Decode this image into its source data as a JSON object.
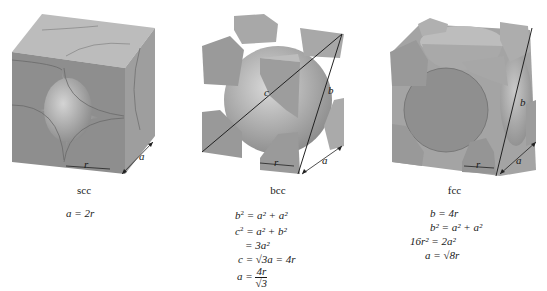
{
  "panels": [
    {
      "id": "scc",
      "caption": "scc",
      "labels": {
        "r": "r",
        "a": "a"
      },
      "equations": [
        "a = 2r"
      ]
    },
    {
      "id": "bcc",
      "caption": "bcc",
      "labels": {
        "r": "r",
        "a": "a",
        "b": "b",
        "c": "c"
      },
      "equations": [
        {
          "lhs": "b",
          "lhs_sup": "2",
          "rhs": "= a² + a²"
        },
        {
          "lhs": "c",
          "lhs_sup": "2",
          "rhs": "= a² + b²"
        },
        {
          "lhs": "",
          "lhs_sup": "",
          "rhs": "= 3a²"
        },
        {
          "lhs": "c",
          "lhs_sup": "",
          "rhs": "= √3a = 4r"
        },
        {
          "lhs": "a",
          "lhs_sup": "",
          "rhs": "=",
          "frac_num": "4r",
          "frac_den": "√3"
        }
      ]
    },
    {
      "id": "fcc",
      "caption": "fcc",
      "labels": {
        "r": "r",
        "a": "a",
        "b": "b"
      },
      "equations": [
        {
          "lhs": "b",
          "rhs": "= 4r"
        },
        {
          "lhs": "b²",
          "rhs": "= a² + a²"
        },
        {
          "lhs": "16r²",
          "rhs": "= 2a²"
        },
        {
          "lhs": "a",
          "rhs": "= √8r"
        }
      ]
    }
  ],
  "colors": {
    "face_front": "#8c8c8c",
    "face_top": "#b9b9b9",
    "face_side": "#a3a3a3",
    "sphere": "#a9a9a9",
    "line": "#222222"
  }
}
